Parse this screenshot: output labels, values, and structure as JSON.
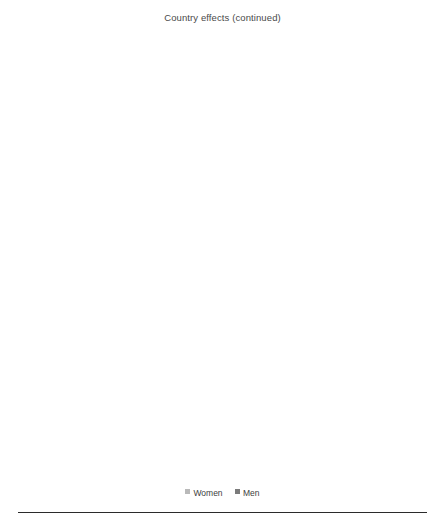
{
  "chart_data": {
    "type": "bar",
    "orientation": "horizontal",
    "title": "Country effects (continued)",
    "xlabel": "",
    "ylabel": "",
    "xlim": [
      -12,
      16
    ],
    "xticks": [
      -12,
      -8,
      -4,
      0,
      4,
      8,
      12,
      16
    ],
    "xtick_labels": [
      "−12",
      "−8",
      "−4",
      "0",
      "4",
      "8",
      "12",
      "16"
    ],
    "grid": true,
    "grid_axis": "x",
    "legend": {
      "position": "bottom",
      "entries": [
        {
          "name": "Women",
          "color": "#b9b9b9"
        },
        {
          "name": "Men",
          "color": "#7b7b7b"
        }
      ]
    },
    "series_names": [
      "Women",
      "Men"
    ],
    "colors": {
      "women": "#b9b9b9",
      "men": "#7b7b7b"
    },
    "panels": [
      {
        "id": "uk",
        "categories": [
          "UK*child<3",
          "UK*partner",
          "UK*univ",
          "UK*lower ed",
          "United Kingdom"
        ],
        "series": [
          {
            "name": "Women",
            "values": [
              0.0,
              0.0,
              4.0,
              0.0,
              0.2
            ]
          },
          {
            "name": "Men",
            "values": [
              -1.0,
              0.0,
              -1.6,
              -1.2,
              3.1
            ]
          }
        ]
      },
      {
        "id": "east-germany",
        "categories": [
          "E Germany*child<3",
          "E Germany*partner",
          "E Germany*univ",
          "E Germany*lower ed",
          "East Germany"
        ],
        "series": [
          {
            "name": "Women",
            "values": [
              0.0,
              0.0,
              0.0,
              0.0,
              3.4
            ]
          },
          {
            "name": "Men",
            "values": [
              0.0,
              -3.7,
              -3.3,
              -2.6,
              7.9
            ]
          }
        ]
      },
      {
        "id": "west-germany",
        "categories": [
          "W Germany* child<3",
          "W Germany*partner",
          "W Germany*univ",
          "W Germany*lower ed",
          "West Germany"
        ],
        "series": [
          {
            "name": "Women",
            "values": [
              0.0,
              -9.0,
              -6.3,
              0.0,
              6.4
            ]
          },
          {
            "name": "Men",
            "values": [
              -1.8,
              -4.3,
              -4.3,
              -4.3,
              9.3
            ]
          }
        ]
      }
    ]
  },
  "caption": ""
}
